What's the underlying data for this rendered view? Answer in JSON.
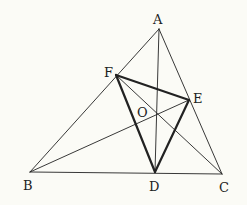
{
  "diagram": {
    "title": "",
    "points": {
      "A": {
        "label": "A"
      },
      "B": {
        "label": "B"
      },
      "C": {
        "label": "C"
      },
      "D": {
        "label": "D"
      },
      "E": {
        "label": "E"
      },
      "F": {
        "label": "F"
      },
      "O": {
        "label": "O"
      }
    },
    "segments": [
      {
        "from": "A",
        "to": "B",
        "style": "thin"
      },
      {
        "from": "B",
        "to": "C",
        "style": "thin"
      },
      {
        "from": "C",
        "to": "A",
        "style": "thin"
      },
      {
        "from": "A",
        "to": "D",
        "style": "thin"
      },
      {
        "from": "B",
        "to": "E",
        "style": "thin"
      },
      {
        "from": "C",
        "to": "F",
        "style": "thin"
      },
      {
        "from": "D",
        "to": "E",
        "style": "thick"
      },
      {
        "from": "E",
        "to": "F",
        "style": "thick"
      },
      {
        "from": "F",
        "to": "D",
        "style": "thick"
      }
    ],
    "colors": {
      "line": "#222222",
      "background": "#fbfbf6"
    }
  }
}
